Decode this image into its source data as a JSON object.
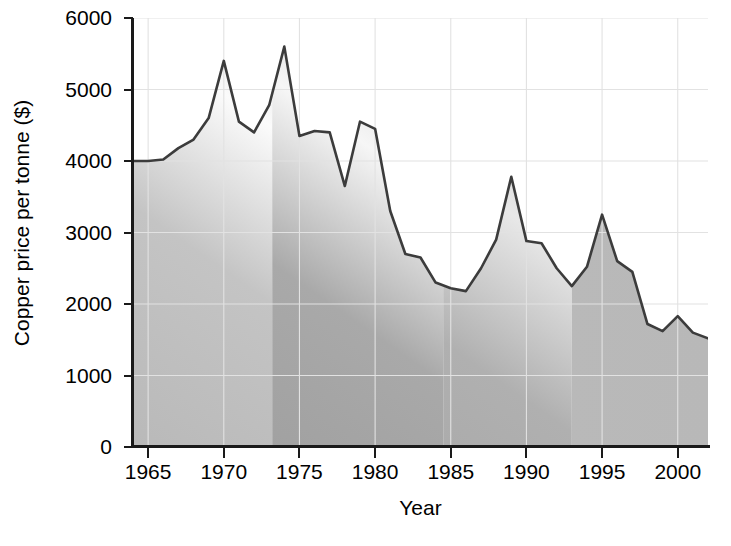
{
  "chart_data": {
    "type": "area",
    "title": "",
    "xlabel": "Year",
    "ylabel": "Copper price per tonne ($)",
    "xlim": [
      1964,
      2002
    ],
    "ylim": [
      0,
      6000
    ],
    "grid": true,
    "legend": "none",
    "xticks": [
      1965,
      1970,
      1975,
      1980,
      1985,
      1990,
      1995,
      2000
    ],
    "xtick_labels": [
      "1965",
      "1970",
      "1975",
      "1980",
      "1985",
      "1990",
      "1995",
      "2000"
    ],
    "yticks": [
      0,
      1000,
      2000,
      3000,
      4000,
      5000,
      6000
    ],
    "ytick_labels": [
      "0",
      "1000",
      "2000",
      "3000",
      "4000",
      "5000",
      "6000"
    ],
    "series": [
      {
        "name": "Copper price per tonne ($)",
        "x": [
          1964,
          1965,
          1966,
          1967,
          1968,
          1969,
          1970,
          1971,
          1972,
          1973,
          1974,
          1975,
          1976,
          1977,
          1978,
          1979,
          1980,
          1981,
          1982,
          1983,
          1984,
          1985,
          1986,
          1987,
          1988,
          1989,
          1990,
          1991,
          1992,
          1993,
          1994,
          1995,
          1996,
          1997,
          1998,
          1999,
          2000,
          2001,
          2002
        ],
        "values": [
          4000,
          4000,
          4020,
          4180,
          4300,
          4600,
          5400,
          4550,
          4400,
          4780,
          5600,
          4350,
          4420,
          4400,
          3650,
          4550,
          4450,
          3300,
          2700,
          2650,
          2300,
          2220,
          2180,
          2500,
          2900,
          3780,
          2880,
          2850,
          2500,
          2250,
          2520,
          3250,
          2600,
          2450,
          1720,
          1620,
          1830,
          1600,
          1520
        ]
      }
    ],
    "colors": {
      "line": "#3c3c3c",
      "fill_light": "#f2f2f2",
      "fill_mid": "#bdbdbd",
      "fill_dark": "#9a9a9a",
      "grid": "#e2e2e2",
      "axis": "#1a1a1a",
      "text": "#000000"
    }
  }
}
